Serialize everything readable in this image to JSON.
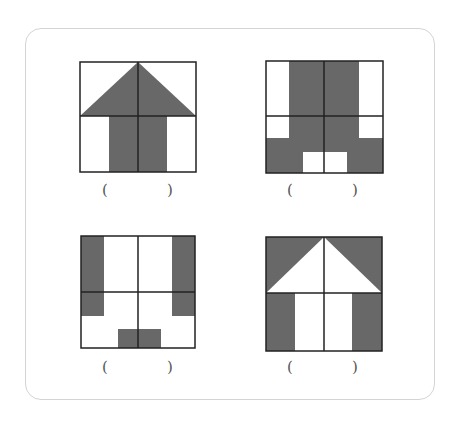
{
  "colors": {
    "fill": "#686868",
    "line": "#222222",
    "background": "#ffffff",
    "card_border": "#d4d4d4",
    "paren": "#555555"
  },
  "figures": [
    {
      "id": "house-up",
      "left_paren": "(",
      "right_paren": ")",
      "x": 79,
      "y": 61,
      "size": 117
    },
    {
      "id": "pants",
      "left_paren": "(",
      "right_paren": ")",
      "x": 265,
      "y": 60,
      "size": 118
    },
    {
      "id": "u-shape",
      "left_paren": "(",
      "right_paren": ")",
      "x": 80,
      "y": 235,
      "size": 115
    },
    {
      "id": "house-inverse",
      "left_paren": "(",
      "right_paren": ")",
      "x": 265,
      "y": 236,
      "size": 116
    }
  ]
}
